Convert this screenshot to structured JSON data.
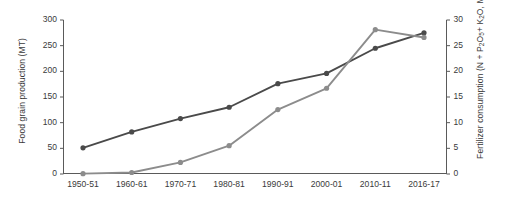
{
  "chart_data": {
    "type": "line",
    "title": "",
    "xlabel": "",
    "categories": [
      "1950-51",
      "1960-61",
      "1970-71",
      "1980-81",
      "1990-91",
      "2000-01",
      "2010-11",
      "2016-17"
    ],
    "grid": false,
    "legend": "none",
    "axes": {
      "left": {
        "label": "Food grain production (MT)",
        "ticks": [
          "0",
          "50",
          "100",
          "150",
          "200",
          "250",
          "300"
        ],
        "tick_values": [
          0,
          50,
          100,
          150,
          200,
          250,
          300
        ],
        "ylim": [
          0,
          300
        ]
      },
      "right": {
        "label_part1": "Fertilizer consumption (N + P",
        "label_sub1": "2",
        "label_part2": "O",
        "label_sub2": "5",
        "label_part3": "+ K",
        "label_sub3": "2",
        "label_part4": "O, MMT)",
        "label_plain": "Fertilizer consumption (N + P2O5 + K2O, MMT)",
        "ticks": [
          "0",
          "5",
          "10",
          "15",
          "20",
          "25",
          "30"
        ],
        "tick_values": [
          0,
          5,
          10,
          15,
          20,
          25,
          30
        ],
        "ylim": [
          0,
          30
        ]
      }
    },
    "series": [
      {
        "name": "Food grain production (MT)",
        "axis": "left",
        "color": "#4a4a4a",
        "marker": "circle",
        "values": [
          51,
          82,
          108,
          130,
          176,
          196,
          245,
          275
        ]
      },
      {
        "name": "Fertilizer consumption (N + P2O5 + K2O, MMT)",
        "axis": "right",
        "color": "#8c8c8c",
        "marker": "circle",
        "values": [
          0.07,
          0.29,
          2.26,
          5.52,
          12.55,
          16.7,
          28.12,
          26.6
        ]
      }
    ]
  }
}
